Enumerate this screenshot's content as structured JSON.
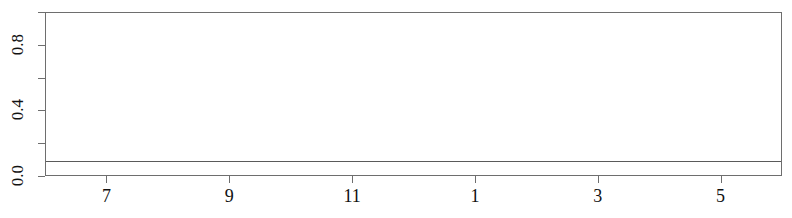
{
  "figure": {
    "title": "",
    "width": 792,
    "height": 218,
    "background_color": "#ffffff",
    "foreground_color": "#111111"
  },
  "chart_data": {
    "type": "line",
    "title": "",
    "xlabel": "",
    "ylabel": "",
    "xlim": [
      6.0,
      18.0
    ],
    "ylim": [
      0.0,
      1.0
    ],
    "grid": false,
    "legend": null,
    "x_ticks": {
      "positions": [
        7,
        9,
        11,
        13,
        15,
        17
      ],
      "labels": [
        "7",
        "9",
        "11",
        "1",
        "3",
        "5"
      ]
    },
    "y_ticks": {
      "positions": [
        0.0,
        0.2,
        0.4,
        0.6,
        0.8,
        1.0
      ],
      "labels": [
        "0.0",
        "",
        "0.4",
        "",
        "0.8",
        ""
      ]
    },
    "series": [
      {
        "name": "series-1",
        "style": "solid",
        "color": "#5a5a5a",
        "x": [
          6.0,
          18.0
        ],
        "values": [
          0.1,
          0.1
        ]
      },
      {
        "name": "series-2",
        "style": "dashed",
        "color": "#4a4a4a",
        "x": [
          9.65,
          17.65
        ],
        "values": [
          0.015,
          0.015
        ]
      }
    ]
  },
  "axes": {
    "y_tick_labels": [
      {
        "text": "0.0",
        "value": 0.0
      },
      {
        "text": "",
        "value": 0.2
      },
      {
        "text": "0.4",
        "value": 0.4
      },
      {
        "text": "",
        "value": 0.6
      },
      {
        "text": "0.8",
        "value": 0.8
      },
      {
        "text": "",
        "value": 1.0
      }
    ],
    "x_tick_labels": [
      {
        "text": "7",
        "value": 7
      },
      {
        "text": "9",
        "value": 9
      },
      {
        "text": "11",
        "value": 11
      },
      {
        "text": "1",
        "value": 13
      },
      {
        "text": "3",
        "value": 15
      },
      {
        "text": "5",
        "value": 17
      }
    ]
  }
}
